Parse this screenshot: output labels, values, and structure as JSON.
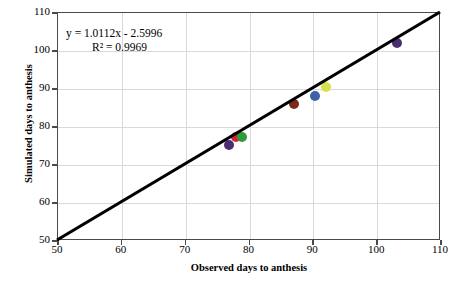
{
  "chart_data": {
    "type": "scatter",
    "title": "",
    "xlabel": "Observed days to anthesis",
    "ylabel": "Simulated days to anthesis",
    "xlim": [
      50,
      110
    ],
    "ylim": [
      50,
      110
    ],
    "xticks": [
      50,
      60,
      70,
      80,
      90,
      100,
      110
    ],
    "yticks": [
      50,
      60,
      70,
      80,
      90,
      100,
      110
    ],
    "grid": true,
    "legend": "none",
    "annotations": {
      "equation": "y = 1.0112x - 2.5996",
      "r_squared": "R² = 0.9969",
      "slope": 1.0112,
      "intercept": -2.5996,
      "r2_value": 0.9969
    },
    "reference_line": {
      "name": "1:1 line",
      "x": [
        50,
        110
      ],
      "y": [
        50,
        110
      ],
      "color": "#000000"
    },
    "points": [
      {
        "x": 77.0,
        "y": 75.0,
        "color": "#4B2D73"
      },
      {
        "x": 78.1,
        "y": 77.0,
        "color": "#D92235"
      },
      {
        "x": 79.0,
        "y": 77.1,
        "color": "#2E9B3C"
      },
      {
        "x": 87.2,
        "y": 85.8,
        "color": "#7C2A17"
      },
      {
        "x": 90.4,
        "y": 87.9,
        "color": "#3C62A8"
      },
      {
        "x": 92.2,
        "y": 90.2,
        "color": "#D5E04B"
      },
      {
        "x": 103.2,
        "y": 101.9,
        "color": "#4B2D73"
      }
    ]
  },
  "colors": {
    "axis": "#4a4a4a",
    "grid": "#d9d9d9",
    "line": "#000000",
    "background": "#ffffff",
    "text": "#000000"
  }
}
